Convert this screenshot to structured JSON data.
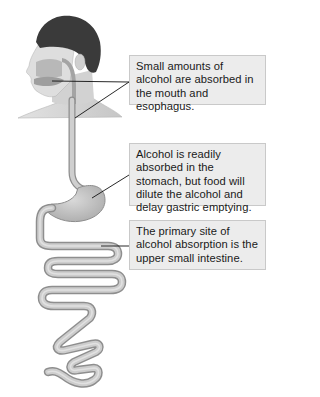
{
  "diagram": {
    "callouts": [
      {
        "id": "mouth-esophagus",
        "text": "Small amounts of alcohol are absorbed in the mouth and esophagus.",
        "points_to": [
          "mouth",
          "esophagus"
        ]
      },
      {
        "id": "stomach",
        "text": "Alcohol is readily absorbed in the stomach, but food will dilute the alcohol and delay gastric emptying.",
        "points_to": [
          "stomach"
        ]
      },
      {
        "id": "small-intestine",
        "text": "The primary site of alcohol absorption is the upper small intestine.",
        "points_to": [
          "small intestine"
        ]
      }
    ],
    "illustration": {
      "parts": [
        "head",
        "mouth",
        "esophagus",
        "stomach",
        "small intestine"
      ]
    },
    "colors": {
      "background": "#ffffff",
      "callout_fill": "#ececec",
      "callout_border": "#c9c9c9",
      "organ_fill": "#c4c4c4",
      "organ_edge": "#8e8e8e",
      "hair": "#3a3a3a",
      "skin": "#d8d8d8",
      "leader_line": "#111111"
    }
  }
}
